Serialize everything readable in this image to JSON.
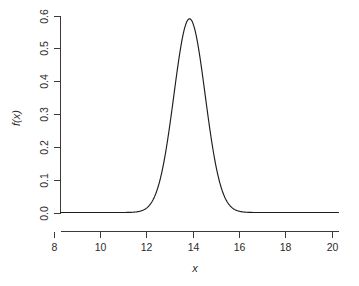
{
  "figure": {
    "background_color": "#ffffff",
    "curve_color": "#1d1d1d",
    "axis_color": "#3a3a3a",
    "text_color": "#2b2b2b"
  },
  "chart_data": {
    "type": "line",
    "title": "",
    "subtitle": "",
    "xlabel": "x",
    "ylabel": "f(x)",
    "xlim": [
      8.3,
      20.3
    ],
    "ylim": [
      0.0,
      0.6
    ],
    "xticks": [
      8,
      10,
      12,
      14,
      16,
      18,
      20
    ],
    "xtick_labels": [
      "8",
      "10",
      "12",
      "14",
      "16",
      "18",
      "20"
    ],
    "yticks": [
      0.0,
      0.1,
      0.2,
      0.3,
      0.4,
      0.5,
      0.6
    ],
    "ytick_labels": [
      "0.0",
      "0.1",
      "0.2",
      "0.3",
      "0.4",
      "0.5",
      "0.6"
    ],
    "grid": false,
    "legend": false,
    "legend_position": "none",
    "distribution": {
      "kind": "normal-density",
      "mean": 13.87,
      "sigma": 0.675,
      "peak_x": 13.87,
      "peak_y": 0.59
    },
    "series": [
      {
        "name": "f(x)",
        "color": "#1d1d1d",
        "x": [
          8.3,
          8.8,
          9.3,
          9.8,
          10.3,
          10.8,
          11.3,
          11.8,
          12.0,
          12.3,
          12.5,
          12.8,
          13.0,
          13.2,
          13.4,
          13.6,
          13.87,
          14.1,
          14.3,
          14.5,
          14.7,
          14.9,
          15.1,
          15.4,
          15.7,
          16.0,
          16.4,
          16.9,
          17.4,
          18.0,
          18.6,
          19.2,
          19.8,
          20.3
        ],
        "y": [
          0.0,
          0.0,
          0.0,
          0.0,
          0.0,
          0.0,
          0.0,
          0.003,
          0.008,
          0.026,
          0.049,
          0.108,
          0.164,
          0.235,
          0.32,
          0.41,
          0.59,
          0.52,
          0.442,
          0.358,
          0.272,
          0.194,
          0.131,
          0.06,
          0.022,
          0.007,
          0.001,
          0.0,
          0.0,
          0.0,
          0.0,
          0.0,
          0.0,
          0.0
        ]
      }
    ]
  },
  "axes": {
    "x_axis_name": "x-axis",
    "y_axis_name": "y-axis"
  }
}
